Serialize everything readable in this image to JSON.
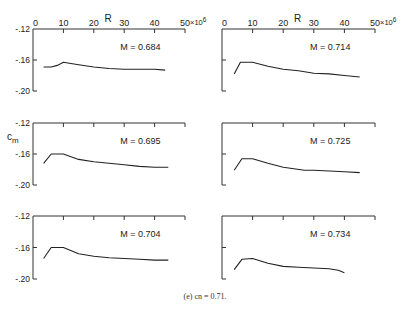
{
  "chart_data": [
    {
      "type": "line",
      "panel": "top-left",
      "annotation": "M = 0.684",
      "xlabel": "R",
      "x_unit_label": "×10⁶",
      "ylabel": "",
      "x_ticks": [
        0,
        10,
        20,
        30,
        40,
        50
      ],
      "y_ticks": [
        "-.12",
        "-.16",
        "-.20"
      ],
      "xlim": [
        0,
        50
      ],
      "ylim": [
        -0.2,
        -0.12
      ],
      "x": [
        3.5,
        6,
        8,
        10,
        15,
        20,
        25,
        30,
        35,
        40,
        43.5
      ],
      "y": [
        -0.169,
        -0.169,
        -0.167,
        -0.163,
        -0.166,
        -0.169,
        -0.171,
        -0.172,
        -0.172,
        -0.172,
        -0.173
      ]
    },
    {
      "type": "line",
      "panel": "top-right",
      "annotation": "M = 0.714",
      "xlabel": "R",
      "x_unit_label": "×10⁶",
      "x_ticks": [
        0,
        10,
        20,
        30,
        40,
        50
      ],
      "xlim": [
        0,
        50
      ],
      "ylim": [
        -0.2,
        -0.12
      ],
      "x": [
        4,
        6,
        10,
        15,
        20,
        25,
        30,
        35,
        40,
        45
      ],
      "y": [
        -0.178,
        -0.163,
        -0.163,
        -0.168,
        -0.172,
        -0.174,
        -0.177,
        -0.178,
        -0.18,
        -0.182
      ]
    },
    {
      "type": "line",
      "panel": "middle-left",
      "annotation": "M = 0.695",
      "ylabel": "cm",
      "y_ticks": [
        "-.12",
        "-.16",
        "-.20"
      ],
      "xlim": [
        0,
        50
      ],
      "ylim": [
        -0.2,
        -0.12
      ],
      "x": [
        3.5,
        6,
        10,
        15,
        20,
        25,
        30,
        35,
        40,
        44.5
      ],
      "y": [
        -0.172,
        -0.16,
        -0.16,
        -0.167,
        -0.17,
        -0.172,
        -0.174,
        -0.176,
        -0.177,
        -0.177
      ]
    },
    {
      "type": "line",
      "panel": "middle-right",
      "annotation": "M = 0.725",
      "xlim": [
        0,
        50
      ],
      "ylim": [
        -0.2,
        -0.12
      ],
      "x": [
        4,
        6.5,
        10,
        15,
        20,
        27,
        30,
        35,
        40,
        45
      ],
      "y": [
        -0.181,
        -0.166,
        -0.166,
        -0.172,
        -0.177,
        -0.181,
        -0.181,
        -0.182,
        -0.183,
        -0.184
      ]
    },
    {
      "type": "line",
      "panel": "bottom-left",
      "annotation": "M = 0.704",
      "y_ticks": [
        "-.12",
        "-.16",
        "-.20"
      ],
      "xlim": [
        0,
        50
      ],
      "ylim": [
        -0.2,
        -0.12
      ],
      "x": [
        3.5,
        6,
        10,
        15,
        20,
        25,
        30,
        35,
        40,
        44.5
      ],
      "y": [
        -0.174,
        -0.16,
        -0.16,
        -0.168,
        -0.171,
        -0.173,
        -0.174,
        -0.175,
        -0.176,
        -0.176
      ]
    },
    {
      "type": "line",
      "panel": "bottom-right",
      "annotation": "M = 0.734",
      "xlim": [
        0,
        50
      ],
      "ylim": [
        -0.2,
        -0.12
      ],
      "x": [
        4,
        6.5,
        10,
        15,
        20,
        25,
        30,
        35,
        38,
        40
      ],
      "y": [
        -0.188,
        -0.175,
        -0.174,
        -0.18,
        -0.184,
        -0.185,
        -0.186,
        -0.187,
        -0.189,
        -0.192
      ]
    }
  ],
  "caption": "(e)  cn = 0.71.",
  "axes": {
    "x_title": "R",
    "x_exponent": "×10",
    "x_exponent_sup": "6",
    "y_title": "c",
    "y_title_sub": "m"
  }
}
